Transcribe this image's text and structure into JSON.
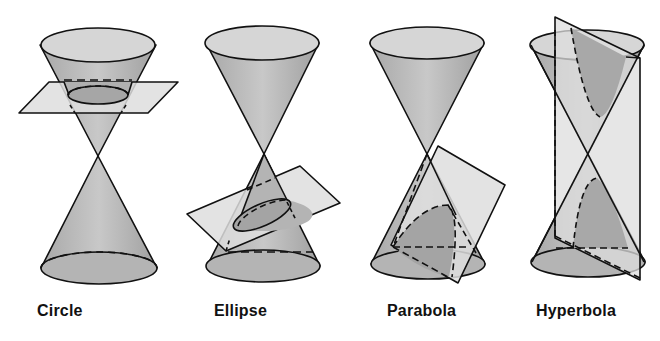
{
  "figure": {
    "background": "#ffffff",
    "colors": {
      "cone_fill": "#b9b9b9",
      "cone_dark": "#a2a2a2",
      "rim_fill": "#d6d6d6",
      "plane_fill": "#dedede",
      "section_fill": "#9a9a9a",
      "stroke": "#111111"
    }
  },
  "panels": [
    {
      "id": "circle",
      "label": "Circle"
    },
    {
      "id": "ellipse",
      "label": "Ellipse"
    },
    {
      "id": "parabola",
      "label": "Parabola"
    },
    {
      "id": "hyperbola",
      "label": "Hyperbola"
    }
  ]
}
